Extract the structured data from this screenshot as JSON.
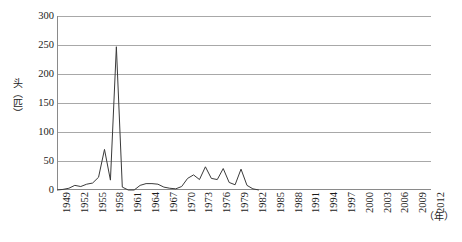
{
  "chart_data": {
    "type": "line",
    "title": "",
    "subtitle": "",
    "xlabel": "（年）",
    "ylabel": "头（匹）",
    "ylim": [
      0,
      300
    ],
    "yticks": [
      0,
      50,
      100,
      150,
      200,
      250,
      300
    ],
    "ytick_labels": [
      "0",
      "50",
      "100",
      "150",
      "200",
      "250",
      "300"
    ],
    "xlim": [
      1949,
      2012
    ],
    "xticks": [
      1949,
      1952,
      1955,
      1958,
      1961,
      1964,
      1967,
      1970,
      1973,
      1976,
      1979,
      1982,
      1985,
      1988,
      1991,
      1994,
      1997,
      2000,
      2003,
      2006,
      2009,
      2012
    ],
    "xtick_labels": [
      "1949",
      "1952",
      "1955",
      "1958",
      "1961",
      "1964",
      "1967",
      "1970",
      "1973",
      "1976",
      "1979",
      "1982",
      "1985",
      "1988",
      "1991",
      "1994",
      "1997",
      "2000",
      "2003",
      "2006",
      "2009",
      "2012"
    ],
    "grid": "horizontal",
    "legend": "none",
    "line_color": "#3a3a3a",
    "grid_color": "#a8a8a8",
    "axis_color": "#8a8a8a",
    "x": [
      1949,
      1950,
      1951,
      1952,
      1953,
      1954,
      1955,
      1956,
      1957,
      1958,
      1959,
      1960,
      1961,
      1962,
      1963,
      1964,
      1965,
      1966,
      1967,
      1968,
      1969,
      1970,
      1971,
      1972,
      1973,
      1974,
      1975,
      1976,
      1977,
      1978,
      1979,
      1980,
      1981,
      1982,
      1983
    ],
    "values": [
      0,
      1,
      3,
      8,
      6,
      10,
      12,
      22,
      70,
      17,
      247,
      5,
      0,
      0,
      8,
      11,
      11,
      10,
      5,
      3,
      2,
      6,
      20,
      26,
      18,
      40,
      20,
      18,
      37,
      13,
      9,
      36,
      8,
      2,
      0
    ],
    "series": [
      {
        "name": "头（匹）",
        "values": [
          0,
          1,
          3,
          8,
          6,
          10,
          12,
          22,
          70,
          17,
          247,
          5,
          0,
          0,
          8,
          11,
          11,
          10,
          5,
          3,
          2,
          6,
          20,
          26,
          18,
          40,
          20,
          18,
          37,
          13,
          9,
          36,
          8,
          2,
          0
        ]
      }
    ],
    "annotations": [],
    "peak_value": 247,
    "peak_year": 1959
  }
}
